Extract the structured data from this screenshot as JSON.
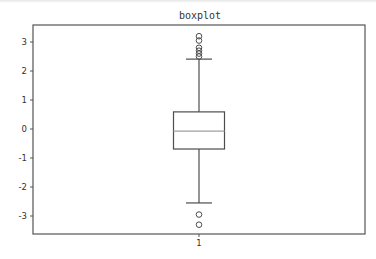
{
  "chart_data": {
    "type": "boxplot",
    "title": "boxplot",
    "xlabel": "",
    "ylabel": "",
    "categories": [
      "1"
    ],
    "ylim": [
      -3.6,
      3.6
    ],
    "yticks": [
      -3,
      -2,
      -1,
      0,
      1,
      2,
      3
    ],
    "ytick_labels": [
      "-3",
      "-2",
      "-1",
      "0",
      "1",
      "2",
      "3"
    ],
    "xticks": [
      "1"
    ],
    "grid": false,
    "legend": null,
    "boxes": [
      {
        "label": "1",
        "whisker_low": -2.55,
        "q1": -0.69,
        "median": -0.07,
        "q3": 0.59,
        "whisker_high": 2.41,
        "outliers": [
          3.2,
          3.05,
          2.8,
          2.7,
          2.6,
          2.5,
          -2.95,
          -3.3
        ]
      }
    ],
    "colors": {
      "box": "#4d4d4d",
      "median": "#a0a0a0",
      "axes": "#555555"
    }
  }
}
